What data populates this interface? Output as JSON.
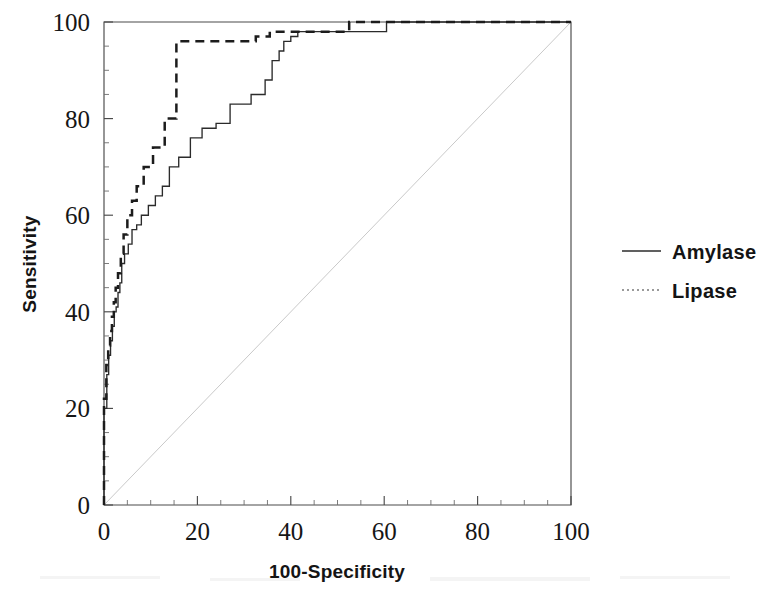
{
  "figure": {
    "kind": "roc-curve-figure",
    "background": "#ffffff",
    "ink_color": "#1a1a1a"
  },
  "axes": {
    "x_title": "100-Specificity",
    "y_title": "Sensitivity",
    "x_ticks": [
      "0",
      "20",
      "40",
      "60",
      "80",
      "100"
    ],
    "y_ticks": [
      "0",
      "20",
      "40",
      "60",
      "80",
      "100"
    ],
    "x_tick_values": [
      0,
      20,
      40,
      60,
      80,
      100
    ],
    "y_tick_values": [
      0,
      20,
      40,
      60,
      80,
      100
    ],
    "minor_tick_step": 5
  },
  "legend": {
    "position": "right",
    "items": [
      {
        "label": "Amylase",
        "style": "solid",
        "color": "#2b2b2b"
      },
      {
        "label": "Lipase",
        "style": "dotted",
        "color": "#9a9a9a"
      }
    ]
  },
  "chart_data": {
    "type": "line",
    "title": "",
    "subtitle": "",
    "xlabel": "100-Specificity",
    "ylabel": "Sensitivity",
    "xlim": [
      0,
      100
    ],
    "ylim": [
      0,
      100
    ],
    "grid": false,
    "legend_position": "right",
    "annotations": [],
    "reference_line": {
      "name": "chance-diagonal",
      "x": [
        0,
        100
      ],
      "y": [
        0,
        100
      ],
      "style": "dotted",
      "color": "#c9c9c9"
    },
    "series": [
      {
        "name": "Amylase",
        "style": "solid",
        "color": "#2b2b2b",
        "x": [
          0,
          0,
          0.6,
          0.6,
          1.0,
          1.0,
          1.4,
          1.4,
          1.8,
          1.8,
          2.2,
          2.2,
          2.6,
          2.6,
          3.0,
          3.0,
          3.4,
          3.4,
          3.8,
          3.8,
          4.4,
          4.4,
          5.2,
          5.2,
          6.0,
          6.0,
          7.0,
          7.0,
          8.0,
          8.0,
          9.5,
          9.5,
          11.0,
          11.0,
          12.5,
          12.5,
          14.0,
          14.0,
          16.0,
          16.0,
          18.5,
          18.5,
          21.0,
          21.0,
          24.0,
          24.0,
          27.0,
          27.0,
          31.5,
          31.5,
          34.5,
          34.5,
          36.0,
          36.0,
          37.5,
          37.5,
          38.5,
          38.5,
          40.0,
          40.0,
          41.5,
          41.5,
          60.5,
          60.5,
          100
        ],
        "y": [
          0,
          20,
          20,
          27,
          27,
          31,
          31,
          34,
          34,
          37,
          37,
          40,
          40,
          41,
          41,
          44,
          44,
          46,
          46,
          50,
          50,
          52,
          52,
          54,
          54,
          57,
          57,
          58,
          58,
          60,
          60,
          62,
          62,
          64,
          64,
          66,
          66,
          70,
          70,
          72,
          72,
          76,
          76,
          78,
          78,
          79,
          79,
          83,
          83,
          85,
          85,
          88,
          88,
          92,
          92,
          94,
          94,
          96,
          96,
          97,
          97,
          98,
          98,
          100,
          100
        ],
        "notes": "Steep near-vertical rise at x~0-1 to ~45 sensitivity, then a long staircase climb, reaching 100 at x~60."
      },
      {
        "name": "Lipase",
        "style": "dashed",
        "color": "#1c1c1c",
        "x": [
          0,
          0,
          0.5,
          0.5,
          0.9,
          0.9,
          1.3,
          1.3,
          1.7,
          1.7,
          2.1,
          2.1,
          2.5,
          2.5,
          3.0,
          3.0,
          3.6,
          3.6,
          4.2,
          4.2,
          5.0,
          5.0,
          6.0,
          6.0,
          7.0,
          7.0,
          8.5,
          8.5,
          10.5,
          10.5,
          13.0,
          13.0,
          15.5,
          15.5,
          32.5,
          32.5,
          35.5,
          35.5,
          52.5,
          52.5,
          100
        ],
        "y": [
          0,
          22,
          22,
          29,
          29,
          33,
          33,
          36,
          36,
          39,
          39,
          42,
          42,
          45,
          45,
          48,
          48,
          52,
          52,
          56,
          56,
          60,
          60,
          63,
          63,
          66,
          66,
          70,
          70,
          74,
          74,
          80,
          80,
          96,
          96,
          97,
          97,
          98,
          98,
          100,
          100
        ],
        "notes": "Rises faster than Amylase; plateaus at ~96 from x~16 to x~32, then steps to 100 at x~53."
      }
    ]
  }
}
